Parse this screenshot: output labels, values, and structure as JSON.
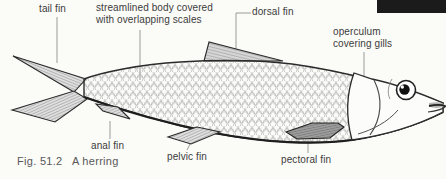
{
  "figure": {
    "caption": "Fig. 51.2   A herring",
    "type": "labeled anatomical diagram of a fish (herring)"
  },
  "labels": {
    "tail_fin": "tail fin",
    "body": "streamlined body covered\nwith overlapping scales",
    "dorsal_fin": "dorsal fin",
    "operculum": "operculum\ncovering gills",
    "anal_fin": "anal fin",
    "pelvic_fin": "pelvic fin",
    "pectoral_fin": "pectoral fin"
  },
  "colors": {
    "background": "#fbfbf8",
    "ink": "#2b2b2b",
    "leader_line": "#9a9a9a",
    "label_text": "#3b3b3b",
    "caption_text": "#585858",
    "scale_outline": "#b9b9b9",
    "fin_hatch": "#6f6f6f",
    "pectoral_fill": "#9c9c9c",
    "photo_fragment": "#1b1b1b"
  }
}
